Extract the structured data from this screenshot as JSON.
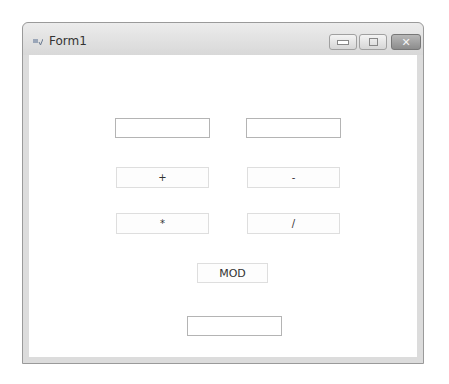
{
  "window": {
    "title": "Form1",
    "icon": "form-icon",
    "controls": {
      "minimize": "minimize-icon",
      "maximize": "maximize-icon",
      "close": "close-icon",
      "close_glyph": "✕"
    }
  },
  "form": {
    "input1": {
      "value": ""
    },
    "input2": {
      "value": ""
    },
    "buttons": {
      "add": "+",
      "subtract": "-",
      "multiply": "*",
      "divide": "/",
      "mod": "MOD"
    },
    "result": {
      "value": ""
    }
  }
}
